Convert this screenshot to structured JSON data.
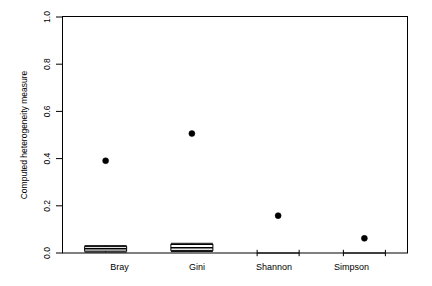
{
  "chart_data": {
    "type": "box",
    "title": "",
    "xlabel": "",
    "ylabel": "Computed heterogeneity measure",
    "ylim": [
      0.0,
      1.0
    ],
    "yticks": [
      "0.0",
      "0.2",
      "0.4",
      "0.6",
      "0.8",
      "1.0"
    ],
    "ytick_values": [
      0.0,
      0.2,
      0.4,
      0.6,
      0.8,
      1.0
    ],
    "grid": false,
    "legend": "none",
    "categories": [
      "Bray",
      "Gini",
      "Shannon",
      "Simpson"
    ],
    "boxes": [
      {
        "category": "Bray",
        "whisker_low": 0.004,
        "q1": 0.008,
        "median": 0.018,
        "q3": 0.027,
        "whisker_high": 0.031,
        "outliers": [
          0.39
        ]
      },
      {
        "category": "Gini",
        "whisker_low": 0.006,
        "q1": 0.011,
        "median": 0.022,
        "q3": 0.036,
        "whisker_high": 0.041,
        "outliers": [
          0.505
        ]
      },
      {
        "category": "Shannon",
        "whisker_low": 0.0,
        "q1": 0.0,
        "median": 0.0,
        "q3": 0.0,
        "whisker_high": 0.0,
        "outliers": [
          0.158
        ]
      },
      {
        "category": "Simpson",
        "whisker_low": 0.0,
        "q1": 0.0,
        "median": 0.0,
        "q3": 0.0,
        "whisker_high": 0.0,
        "outliers": [
          0.062
        ]
      }
    ]
  },
  "axis": {
    "y_label": "Computed heterogeneity measure",
    "y_ticks": [
      "0.0",
      "0.2",
      "0.4",
      "0.6",
      "0.8",
      "1.0"
    ],
    "x_labels": [
      "Bray",
      "Gini",
      "Shannon",
      "Simpson"
    ]
  },
  "colors": {
    "axis": "#000000",
    "box_line": "#000000",
    "box_fill": "#ffffff",
    "point": "#000000",
    "background": "#ffffff"
  }
}
